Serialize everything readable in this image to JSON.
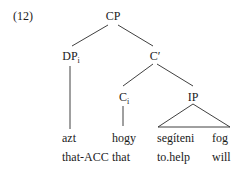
{
  "example_number": "(12)",
  "tree": {
    "root": {
      "label": "CP"
    },
    "dp": {
      "label": "DP",
      "index": "i"
    },
    "cbar": {
      "label": "C′"
    },
    "c": {
      "label": "C",
      "index": "i"
    },
    "ip": {
      "label": "IP"
    }
  },
  "words": [
    {
      "form": "azt",
      "gloss": "that-ACC"
    },
    {
      "form": "hogy",
      "gloss": "that"
    },
    {
      "form": "segíteni",
      "gloss": "to.help"
    },
    {
      "form": "fog",
      "gloss": "will"
    }
  ]
}
